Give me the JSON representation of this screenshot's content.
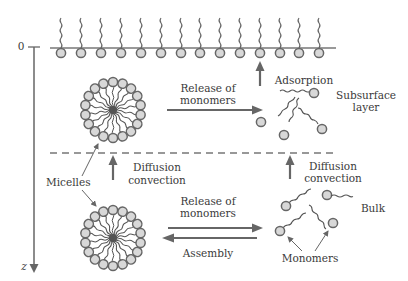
{
  "diagram": {
    "axis": {
      "origin_label": "0",
      "depth_label": "z"
    },
    "labels": {
      "release_upper_1": "Release of",
      "release_upper_2": "monomers",
      "adsorption": "Adsorption",
      "subsurface_1": "Subsurface",
      "subsurface_2": "layer",
      "diffusion_left_1": "Diffusion",
      "diffusion_left_2": "convection",
      "diffusion_right_1": "Diffusion",
      "diffusion_right_2": "convection",
      "micelles": "Micelles",
      "release_lower_1": "Release of",
      "release_lower_2": "monomers",
      "assembly": "Assembly",
      "bulk": "Bulk",
      "monomers": "Monomers"
    },
    "colors": {
      "stroke": "#6a6a6a",
      "head_fill": "#d6d6d6",
      "head_stroke": "#6a6a6a",
      "text": "#3a3a3a"
    }
  }
}
